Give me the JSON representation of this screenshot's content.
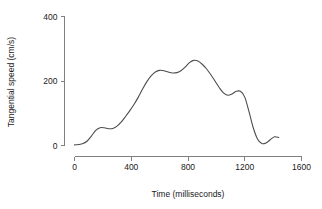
{
  "chart_data": {
    "type": "line",
    "title": "",
    "subtitle": "",
    "xlabel": "Time (milliseconds)",
    "ylabel": "Tangential speed (cm/s)",
    "xlim": [
      0,
      1600
    ],
    "ylim": [
      0,
      400
    ],
    "xticks": [
      0,
      400,
      800,
      1200,
      1600
    ],
    "xtick_labels": [
      "0",
      "400",
      "800",
      "1200",
      "1600"
    ],
    "yticks": [
      0,
      200,
      400
    ],
    "ytick_labels": [
      "0",
      "200",
      "400"
    ],
    "grid": false,
    "legend": null,
    "line_color": "#4d4d4d",
    "axis_color": "#808080",
    "series": [
      {
        "name": "tangential speed",
        "x": [
          0,
          30,
          60,
          90,
          120,
          150,
          180,
          210,
          240,
          270,
          300,
          330,
          360,
          390,
          420,
          450,
          480,
          510,
          540,
          570,
          600,
          630,
          660,
          690,
          720,
          750,
          780,
          810,
          840,
          870,
          900,
          930,
          960,
          990,
          1020,
          1050,
          1080,
          1110,
          1140,
          1170,
          1200,
          1230,
          1260,
          1290,
          1320,
          1350,
          1380,
          1410,
          1440
        ],
        "y": [
          2,
          3,
          6,
          14,
          30,
          47,
          55,
          55,
          52,
          53,
          60,
          73,
          90,
          108,
          128,
          150,
          175,
          198,
          216,
          228,
          233,
          232,
          228,
          225,
          226,
          232,
          243,
          257,
          264,
          262,
          252,
          238,
          220,
          200,
          180,
          163,
          156,
          160,
          168,
          168,
          150,
          105,
          55,
          20,
          6,
          8,
          18,
          27,
          25
        ]
      }
    ],
    "annotations": []
  },
  "figure": {
    "background_color": "#ffffff",
    "width": 322,
    "height": 209
  }
}
